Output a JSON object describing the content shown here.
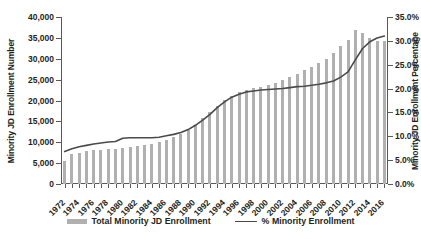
{
  "chart_data": {
    "type": "bar",
    "title": "",
    "xlabel": "",
    "ylabel": "Minority JD Enrollment Number",
    "y2label": "Minority JD Enrollment Percentage",
    "ylim": [
      0,
      40000
    ],
    "y2lim": [
      0,
      0.35
    ],
    "ytick_labels": [
      "40,000",
      "35,000",
      "30,000",
      "25,000",
      "20,000",
      "15,000",
      "10,000",
      "5,000",
      "0"
    ],
    "ytick_values": [
      40000,
      35000,
      30000,
      25000,
      20000,
      15000,
      10000,
      5000,
      0
    ],
    "y2tick_labels": [
      "35.0%",
      "30.0%",
      "25.0%",
      "20.0%",
      "15.0%",
      "10.0%",
      "5.0%",
      "0.0%"
    ],
    "y2tick_values": [
      35.0,
      30.0,
      25.0,
      20.0,
      15.0,
      10.0,
      5.0,
      0.0
    ],
    "grid": false,
    "legend_position": "bottom",
    "categories": [
      1972,
      1973,
      1974,
      1975,
      1976,
      1977,
      1978,
      1979,
      1980,
      1981,
      1982,
      1983,
      1984,
      1985,
      1986,
      1987,
      1988,
      1989,
      1990,
      1991,
      1992,
      1993,
      1994,
      1995,
      1996,
      1997,
      1998,
      1999,
      2000,
      2001,
      2002,
      2003,
      2004,
      2005,
      2006,
      2007,
      2008,
      2009,
      2010,
      2011,
      2012,
      2013,
      2014,
      2015,
      2016
    ],
    "xtick_labels": [
      "1972",
      "1974",
      "1976",
      "1978",
      "1980",
      "1982",
      "1984",
      "1986",
      "1988",
      "1990",
      "1992",
      "1994",
      "1996",
      "1998",
      "2000",
      "2002",
      "2004",
      "2006",
      "2008",
      "2010",
      "2012",
      "2014",
      "2016"
    ],
    "series": [
      {
        "name": "Total Minority JD Enrollment",
        "type": "bar",
        "axis": "left",
        "color": "#b0b0b0",
        "values": [
          5568,
          7200,
          7500,
          7800,
          8100,
          8250,
          8400,
          8500,
          8700,
          8900,
          9100,
          9400,
          9700,
          10100,
          10600,
          11200,
          11900,
          12900,
          14200,
          15800,
          17300,
          18800,
          20100,
          21200,
          22000,
          22600,
          23000,
          23300,
          23600,
          24100,
          24800,
          25600,
          26400,
          27200,
          28000,
          28900,
          30000,
          31300,
          33000,
          34500,
          37000,
          36200,
          35000,
          34300,
          34200
        ]
      },
      {
        "name": "% Minority Enrollment",
        "type": "line",
        "axis": "right",
        "color": "#4a4a4a",
        "values": [
          6.8,
          7.4,
          7.8,
          8.1,
          8.4,
          8.6,
          8.8,
          8.9,
          9.6,
          9.7,
          9.7,
          9.7,
          9.7,
          9.8,
          10.1,
          10.4,
          10.8,
          11.4,
          12.3,
          13.4,
          14.6,
          16.0,
          17.2,
          18.2,
          18.8,
          19.3,
          19.5,
          19.7,
          19.8,
          19.9,
          20.0,
          20.2,
          20.4,
          20.5,
          20.7,
          20.9,
          21.2,
          21.6,
          22.4,
          23.5,
          26.0,
          28.4,
          29.8,
          30.6,
          31.0
        ]
      }
    ],
    "legend": [
      {
        "label": "Total Minority JD Enrollment",
        "marker": "bar",
        "color": "#b0b0b0"
      },
      {
        "label": "% Minority Enrollment",
        "marker": "line",
        "color": "#4a4a4a"
      }
    ]
  }
}
